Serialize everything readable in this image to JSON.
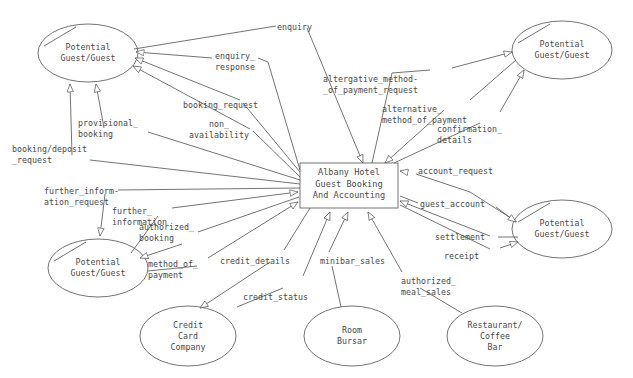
{
  "diagram": {
    "type": "data-flow-diagram",
    "process": {
      "id": "albany-hotel-process",
      "label": "Albany Hotel\nGuest Booking\nAnd Accounting",
      "shape": "rectangle",
      "x": 300,
      "y": 163,
      "w": 98,
      "h": 45
    },
    "entities": [
      {
        "id": "potential-guest-top-left",
        "label": "Potential\nGuest/Guest",
        "shape": "ellipse",
        "cx": 88,
        "cy": 53,
        "rx": 50,
        "ry": 29
      },
      {
        "id": "potential-guest-top-right",
        "label": "Potential\nGuest/Guest",
        "shape": "ellipse",
        "cx": 562,
        "cy": 50,
        "rx": 50,
        "ry": 29
      },
      {
        "id": "potential-guest-left",
        "label": "Potential\nGuest/Guest",
        "shape": "ellipse",
        "cx": 98,
        "cy": 268,
        "rx": 50,
        "ry": 29
      },
      {
        "id": "potential-guest-right",
        "label": "Potential\nGuest/Guest",
        "shape": "ellipse",
        "cx": 562,
        "cy": 229,
        "rx": 50,
        "ry": 29
      },
      {
        "id": "credit-card-company",
        "label": "Credit\nCard\nCompany",
        "shape": "ellipse",
        "cx": 188,
        "cy": 336,
        "rx": 48,
        "ry": 30
      },
      {
        "id": "room-bursar",
        "label": "Room\nBursar",
        "shape": "ellipse",
        "cx": 352,
        "cy": 336,
        "rx": 48,
        "ry": 30
      },
      {
        "id": "restaurant-coffee-bar",
        "label": "Restaurant/\nCoffee\nBar",
        "shape": "ellipse",
        "cx": 495,
        "cy": 336,
        "rx": 48,
        "ry": 30
      }
    ],
    "flows": [
      {
        "id": "flow-enquiry",
        "label": "enquiry",
        "from": "potential-guest-top-right",
        "to": "albany-hotel-process",
        "lx": 277,
        "ly": 22,
        "align": "left"
      },
      {
        "id": "flow-enquiry-response",
        "label": "enquiry_\nresponse",
        "from": "albany-hotel-process",
        "to": "potential-guest-top-left",
        "lx": 215,
        "ly": 51,
        "align": "left"
      },
      {
        "id": "flow-booking-request",
        "label": "booking_request",
        "from": "potential-guest-top-left",
        "to": "albany-hotel-process",
        "lx": 183,
        "ly": 100,
        "align": "left"
      },
      {
        "id": "flow-non-availability",
        "label": "non_\navailability",
        "from": "albany-hotel-process",
        "to": "potential-guest-top-left",
        "lx": 189,
        "ly": 119,
        "align": "left"
      },
      {
        "id": "flow-provisional-booking",
        "label": "provisional_\nbooking",
        "from": "albany-hotel-process",
        "to": "potential-guest-top-left",
        "lx": 78,
        "ly": 118,
        "align": "left"
      },
      {
        "id": "flow-booking-deposit-request",
        "label": "booking/deposit\n_request",
        "from": "albany-hotel-process",
        "to": "potential-guest-top-left",
        "lx": 12,
        "ly": 144,
        "align": "left"
      },
      {
        "id": "flow-alt-method-request",
        "label": "altergative_method-\n_of_payment_request",
        "from": "albany-hotel-process",
        "to": "potential-guest-top-right",
        "lx": 323,
        "ly": 74,
        "align": "left"
      },
      {
        "id": "flow-alt-method-payment",
        "label": "alternative_\nmethod_of_payment",
        "from": "potential-guest-top-right",
        "to": "albany-hotel-process",
        "lx": 382,
        "ly": 104,
        "align": "left"
      },
      {
        "id": "flow-confirmation-details",
        "label": "confirmation_\ndetails",
        "from": "albany-hotel-process",
        "to": "potential-guest-top-right",
        "lx": 437,
        "ly": 124,
        "align": "left"
      },
      {
        "id": "flow-further-info-request",
        "label": "further_inform-\nation_request",
        "from": "albany-hotel-process",
        "to": "potential-guest-left",
        "lx": 44,
        "ly": 186,
        "align": "left"
      },
      {
        "id": "flow-further-information",
        "label": "further_\ninformation",
        "from": "potential-guest-left",
        "to": "albany-hotel-process",
        "lx": 112,
        "ly": 206,
        "align": "left"
      },
      {
        "id": "flow-authorized-booking",
        "label": "authorized_\nbooking",
        "from": "albany-hotel-process",
        "to": "potential-guest-left",
        "lx": 139,
        "ly": 222,
        "align": "left"
      },
      {
        "id": "flow-method-of-payment",
        "label": "method_of_\npayment",
        "from": "potential-guest-left",
        "to": "albany-hotel-process",
        "lx": 148,
        "ly": 259,
        "align": "left"
      },
      {
        "id": "flow-credit-details",
        "label": "credit_details",
        "from": "albany-hotel-process",
        "to": "credit-card-company",
        "lx": 220,
        "ly": 256,
        "align": "left"
      },
      {
        "id": "flow-credit-status",
        "label": "credit_status",
        "from": "credit-card-company",
        "to": "albany-hotel-process",
        "lx": 243,
        "ly": 292,
        "align": "left"
      },
      {
        "id": "flow-minibar-sales",
        "label": "minibar_sales",
        "from": "room-bursar",
        "to": "albany-hotel-process",
        "lx": 320,
        "ly": 256,
        "align": "left"
      },
      {
        "id": "flow-authorized-meal-sales",
        "label": "authorized_\nmeal_sales",
        "from": "restaurant-coffee-bar",
        "to": "albany-hotel-process",
        "lx": 401,
        "ly": 276,
        "align": "left"
      },
      {
        "id": "flow-account-request",
        "label": "account_request",
        "from": "potential-guest-right",
        "to": "albany-hotel-process",
        "lx": 418,
        "ly": 166,
        "align": "left"
      },
      {
        "id": "flow-guest-account",
        "label": "guest_account",
        "from": "albany-hotel-process",
        "to": "potential-guest-right",
        "lx": 420,
        "ly": 199,
        "align": "left"
      },
      {
        "id": "flow-settlement",
        "label": "settlement",
        "from": "potential-guest-right",
        "to": "albany-hotel-process",
        "lx": 435,
        "ly": 232,
        "align": "left"
      },
      {
        "id": "flow-receipt",
        "label": "receipt",
        "from": "albany-hotel-process",
        "to": "potential-guest-right",
        "lx": 444,
        "ly": 251,
        "align": "left"
      }
    ],
    "colors": {
      "stroke": "#5a5a5a",
      "text": "#4a4a4a",
      "background": "#ffffff"
    }
  }
}
